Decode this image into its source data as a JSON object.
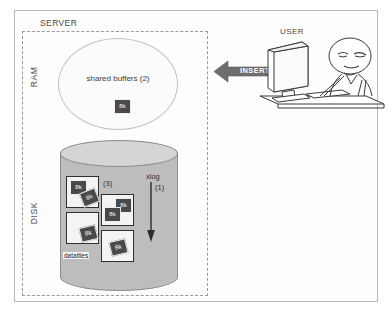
{
  "diagram": {
    "server_label": "SERVER",
    "side_labels": {
      "ram": "RAM",
      "disk": "DISK"
    },
    "ram": {
      "region_name": "shared buffers",
      "region_label": "shared buffers  (2)",
      "step_number": "(2)",
      "blocks": [
        {
          "label": "8k"
        }
      ]
    },
    "disk": {
      "container_name": "disk-cylinder",
      "datafiles_label": "datafiles",
      "datafiles_step": "(3)",
      "xlog_label": "xlog",
      "xlog_step": "(1)",
      "datafiles": [
        {
          "name": "datafile-1",
          "blocks": [
            "8k",
            "8k"
          ]
        },
        {
          "name": "datafile-2",
          "blocks": [
            "8k",
            "8k"
          ]
        },
        {
          "name": "datafile-3",
          "blocks": [
            "8k"
          ]
        },
        {
          "name": "datafile-4",
          "blocks": [
            "8k"
          ]
        }
      ]
    },
    "flow": {
      "insert_label": "INSERT",
      "direction": "right-to-left"
    },
    "user": {
      "label": "USER",
      "scene": "person seated at desk using a monitor and keyboard"
    },
    "colors": {
      "page_background": "#ffffff",
      "frame_border": "#b9b9b9",
      "server_dash_border": "#9a9a9a",
      "ellipse_fill": "#fbfbfb",
      "ellipse_border": "#c2c2c2",
      "cylinder_body": "#bdbdbd",
      "cylinder_top": "#d5d5d5",
      "cylinder_border": "#8c8c8c",
      "block_fill": "#4a4a4a",
      "block_text": "#ffffff",
      "datafile_fill": "#f4f4f4",
      "datafile_border": "#2f2f2f",
      "insert_arrow": "#6e6e6e",
      "line_art": "#3a3a3a",
      "text": "#3d3d3d"
    }
  }
}
